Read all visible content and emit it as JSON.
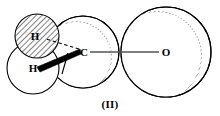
{
  "figure": {
    "caption": "(II)",
    "kind": "molecular-space-filling-diagram",
    "background_color": "#ffffff",
    "stroke_color": "#000000"
  },
  "atoms": [
    {
      "id": "h-upper",
      "label": "H",
      "subscript": "",
      "sphere": {
        "cx": 37,
        "cy": 36,
        "r": 22
      },
      "fill_style": "hatched",
      "fill_color": "#ffffff",
      "label_x": 35,
      "label_y": 40
    },
    {
      "id": "h-lower",
      "label": "H",
      "subscript": "",
      "sphere": {
        "cx": 33,
        "cy": 68,
        "r": 26
      },
      "fill_style": "plain",
      "fill_color": "#ffffff",
      "label_x": 33,
      "label_y": 72
    },
    {
      "id": "c-center",
      "label": "C",
      "subscript": "",
      "sphere": {
        "cx": 83,
        "cy": 52,
        "r": 36
      },
      "fill_style": "rim-hatched",
      "fill_color": "#ffffff",
      "label_x": 84,
      "label_y": 52
    },
    {
      "id": "o-right",
      "label": "O",
      "subscript": "",
      "sphere": {
        "cx": 166,
        "cy": 52,
        "r": 45
      },
      "fill_style": "rim-hatched",
      "fill_color": "#ffffff",
      "label_x": 166,
      "label_y": 52
    }
  ],
  "bonds": [
    {
      "id": "bond-c-h-upper",
      "from": "c-center",
      "to": "h-upper",
      "style": "dashed",
      "x1": 81,
      "y1": 50,
      "x2": 46,
      "y2": 39
    },
    {
      "id": "bond-c-h-lower",
      "from": "c-center",
      "to": "h-lower",
      "style": "wedge-bold",
      "x1": 81,
      "y1": 51,
      "x2": 40,
      "y2": 70
    },
    {
      "id": "bond-c-o",
      "from": "c-center",
      "to": "o-right",
      "style": "solid",
      "x1": 90,
      "y1": 52,
      "x2": 159,
      "y2": 52
    }
  ]
}
